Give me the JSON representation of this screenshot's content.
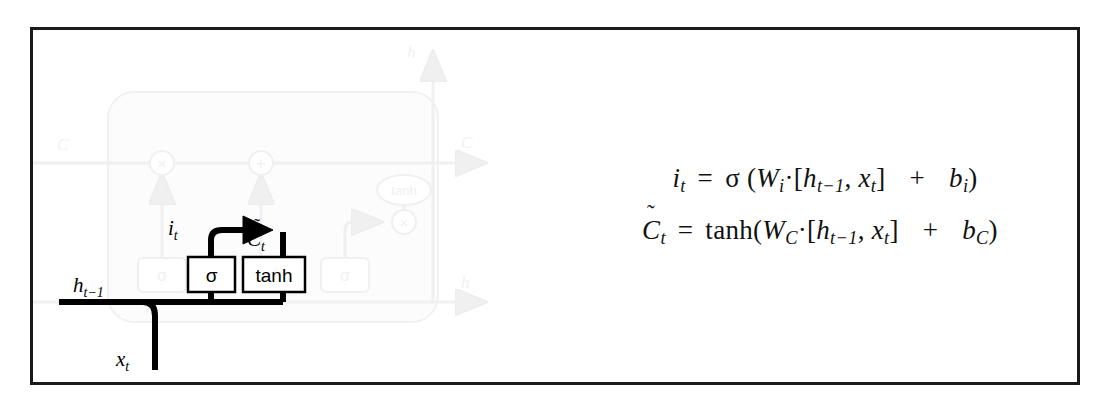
{
  "figure": {
    "kind": "lstm-input-gate-diagram",
    "frame_color": "#1a1a1a",
    "active_color": "#000000",
    "faded_color": "#f2f2f2"
  },
  "diagram": {
    "labels": {
      "h_prev": "h",
      "h_prev_sub": "t−1",
      "x_t": "x",
      "x_t_sub": "t",
      "i_t": "i",
      "i_t_sub": "t",
      "c_tilde": "C",
      "c_tilde_sub": "t",
      "tilde_mark": "˜"
    },
    "gates": {
      "sigma_active": "σ",
      "tanh_active": "tanh",
      "sigma_forget_faded": "σ",
      "sigma_output_faded": "σ",
      "tanh_output_faded": "tanh"
    },
    "operators": {
      "multiply": "×",
      "plus": "+"
    },
    "faded_labels": {
      "c_prev": "C",
      "c_prev_sub": "t−1",
      "c_next": "C",
      "c_next_sub": "t",
      "h_out_top": "h",
      "h_out_top_sub": "t",
      "h_out_right": "h",
      "h_out_right_sub": "t"
    }
  },
  "equations": {
    "eq1": {
      "lhs_var": "i",
      "lhs_sub": "t",
      "equals": "=",
      "activation": "σ",
      "open_paren": "(",
      "weight": "W",
      "weight_sub": "i",
      "dot": "·",
      "bracket_open": "[",
      "h_var": "h",
      "h_sub": "t−1",
      "comma": ",",
      "x_var": "x",
      "x_sub": "t",
      "bracket_close": "]",
      "plus": "+",
      "bias": "b",
      "bias_sub": "i",
      "close_paren": ")",
      "plain": "i_t = σ (W_i·[h_{t−1}, x_t]  +  b_i)"
    },
    "eq2": {
      "lhs_var": "C",
      "lhs_tilde": "˜",
      "lhs_sub": "t",
      "equals": "=",
      "activation": "tanh",
      "open_paren": "(",
      "weight": "W",
      "weight_sub": "C",
      "dot": "·",
      "bracket_open": "[",
      "h_var": "h",
      "h_sub": "t−1",
      "comma": ",",
      "x_var": "x",
      "x_sub": "t",
      "bracket_close": "]",
      "plus": "+",
      "bias": "b",
      "bias_sub": "C",
      "close_paren": ")",
      "plain": "Ĉ_t = tanh(W_C·[h_{t−1}, x_t]  +  b_C)"
    }
  }
}
